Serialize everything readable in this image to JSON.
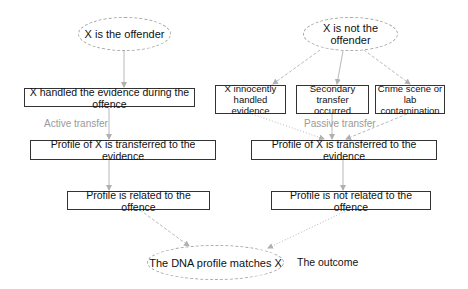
{
  "diagram": {
    "nodes": {
      "offender": "X is the offender",
      "not_offender": "X is not the offender",
      "handled_during": "X handled the evidence during the offence",
      "innocently_handled": "X innocently handled evidence",
      "secondary_transfer": "Secondary transfer occurred",
      "contamination": "Crime scene or lab contamination",
      "transferred_left": "Profile of X is transferred to the evidence",
      "transferred_right": "Profile of X is transferred to the evidence",
      "related": "Profile is related to the offence",
      "not_related": "Profile is not related to the offence",
      "matches": "The DNA profile matches X"
    },
    "labels": {
      "active_transfer": "Active transfer",
      "passive_transfer": "Passive transfer",
      "outcome": "The outcome"
    },
    "colors": {
      "box_border": "#333333",
      "ellipse_border": "#aaaaaa",
      "arrow": "#b0b0b0",
      "label_text": "#9a9a9a"
    },
    "edges": [
      {
        "from": "offender",
        "to": "handled_during",
        "style": "solid"
      },
      {
        "from": "handled_during",
        "to": "transferred_left",
        "style": "solid"
      },
      {
        "from": "transferred_left",
        "to": "related",
        "style": "solid"
      },
      {
        "from": "related",
        "to": "matches",
        "style": "dashed"
      },
      {
        "from": "not_offender",
        "to": "innocently_handled",
        "style": "dashed"
      },
      {
        "from": "not_offender",
        "to": "secondary_transfer",
        "style": "solid"
      },
      {
        "from": "not_offender",
        "to": "contamination",
        "style": "dashed"
      },
      {
        "from": "innocently_handled",
        "to": "transferred_right",
        "style": "dotted"
      },
      {
        "from": "secondary_transfer",
        "to": "transferred_right",
        "style": "solid"
      },
      {
        "from": "contamination",
        "to": "transferred_right",
        "style": "dashed"
      },
      {
        "from": "transferred_right",
        "to": "not_related",
        "style": "solid"
      },
      {
        "from": "not_related",
        "to": "matches",
        "style": "dotted"
      }
    ]
  }
}
